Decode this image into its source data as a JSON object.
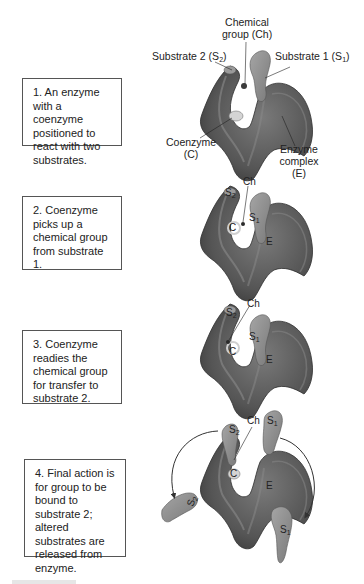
{
  "figure": {
    "steps": [
      {
        "number": 1,
        "text": "1. An enzyme with a coenzyme positioned to react with two substrates."
      },
      {
        "number": 2,
        "text": "2. Coenzyme picks up a chemical group from substrate 1."
      },
      {
        "number": 3,
        "text": "3. Coenzyme readies the chemical group for transfer to substrate 2."
      },
      {
        "number": 4,
        "text": "4. Final action is for group to be bound to substrate 2; altered substrates are released from enzyme."
      }
    ],
    "labels_step1": {
      "chemical_group_line1": "Chemical",
      "chemical_group_line2": "group (Ch)",
      "substrate2_text": "Substrate 2 (S",
      "substrate2_sub": "2",
      "substrate1_text": "Substrate 1 (S",
      "substrate1_sub": "1",
      "close_paren": ")",
      "coenzyme_line1": "Coenzyme",
      "coenzyme_line2": "(C)",
      "enzyme_line1": "Enzyme",
      "enzyme_line2": "complex",
      "enzyme_line3": "(E)"
    },
    "short_labels": {
      "ch": "Ch",
      "s": "S",
      "sub1": "1",
      "sub2": "2",
      "c": "C",
      "e": "E"
    },
    "colors": {
      "enzyme_dark": "#4a4a4a",
      "enzyme_mid": "#6e6e6e",
      "substrate": "#8c8c8c",
      "highlight": "#d0d0d0",
      "box_border": "#555555",
      "text": "#222222"
    }
  }
}
